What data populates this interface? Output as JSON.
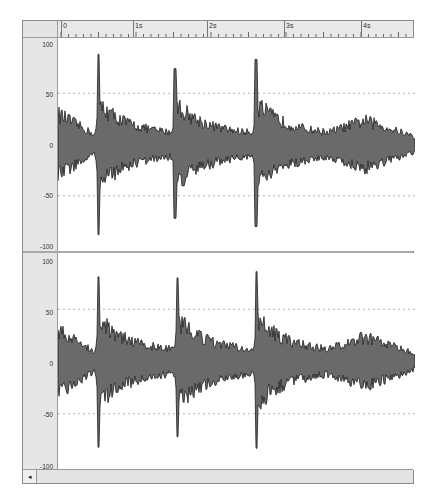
{
  "ruler": {
    "labels": [
      {
        "text": "0",
        "x": 60
      },
      {
        "text": "1s",
        "x": 132
      },
      {
        "text": "2s",
        "x": 206
      },
      {
        "text": "3s",
        "x": 283
      },
      {
        "text": "4s",
        "x": 360
      }
    ]
  },
  "channels": [
    {
      "name": "Channel 1",
      "axis": {
        "top": "100",
        "upper": "50",
        "zero": "0",
        "lower": "-50",
        "bottom": "-100"
      },
      "spikes": [
        {
          "x_sec": 0.5,
          "peak": 88,
          "trough": -88
        },
        {
          "x_sec": 1.52,
          "peak": 74,
          "trough": -72
        },
        {
          "x_sec": 2.6,
          "peak": 83,
          "trough": -80
        }
      ]
    },
    {
      "name": "Channel 2",
      "axis": {
        "top": "100",
        "upper": "50",
        "zero": "0",
        "lower": "-50",
        "bottom": "-100"
      },
      "spikes": [
        {
          "x_sec": 0.5,
          "peak": 81,
          "trough": -82
        },
        {
          "x_sec": 1.55,
          "peak": 80,
          "trough": -72
        },
        {
          "x_sec": 2.61,
          "peak": 86,
          "trough": -83
        }
      ]
    }
  ],
  "colors": {
    "waveform_fill": "#6a6a6a",
    "waveform_stroke": "#1e1e1e",
    "gridline": "#b5b5b5",
    "gutter": "#e6e6e6"
  },
  "scrollbar": {
    "left_arrow": "◂"
  }
}
